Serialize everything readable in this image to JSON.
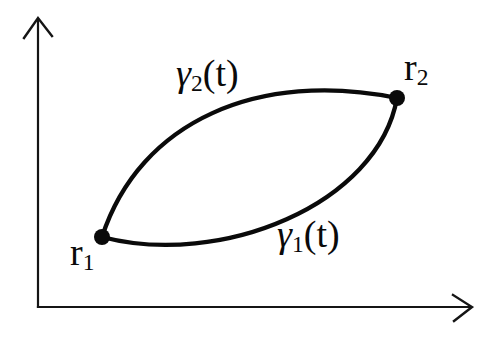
{
  "figure": {
    "background_color": "#ffffff",
    "ink_color": "#0a0a0a",
    "labels": {
      "gamma2": {
        "base": "γ",
        "sub": "2",
        "arg": "(t)"
      },
      "gamma1": {
        "base": "γ",
        "sub": "1",
        "arg": "(t)"
      },
      "r2": {
        "base": "r",
        "sub": "2"
      },
      "r1": {
        "base": "r",
        "sub": "1"
      }
    },
    "points": {
      "r1": {
        "x": 102,
        "y": 237
      },
      "r2": {
        "x": 397,
        "y": 98
      }
    },
    "paths": {
      "y_axis": "M38,307 L38,20",
      "y_arrowhead": "M24,38 L38,18 L52,36",
      "x_axis": "M38,307 L471,307",
      "x_arrowhead": "M453,295 L472,307 L454,321",
      "curve_upper": "M102,237 C140,120 260,70 397,98",
      "curve_lower": "M102,237 C220,268 378,205 397,98",
      "dot_left": "M94,237 a8,8 0 1,0 16,0 a8,8 0 1,0 -16,0",
      "dot_right": "M389,98 a8,8 0 1,0 16,0 a8,8 0 1,0 -16,0"
    }
  }
}
